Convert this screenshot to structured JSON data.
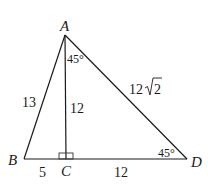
{
  "diagram": {
    "points": {
      "A": "A",
      "B": "B",
      "C": "C",
      "D": "D"
    },
    "segments": {
      "AB": "13",
      "AC": "12",
      "AD_coeff": "12",
      "AD_radicand": "2",
      "BC": "5",
      "CD": "12"
    },
    "angles": {
      "CAD": "45°",
      "ADC": "45°"
    },
    "right_angle_at": "C"
  }
}
